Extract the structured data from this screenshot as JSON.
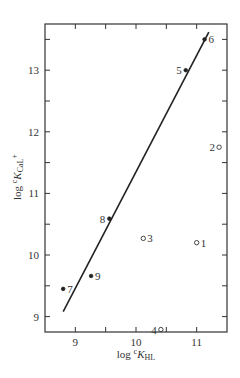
{
  "chart_data": {
    "type": "scatter",
    "title": "",
    "xlabel": "log cK_HL",
    "ylabel": "log cK_CaL+",
    "xlabel_parts": {
      "prefix": "log ",
      "sup": "c",
      "main": "K",
      "sub": "HL",
      "suffix": ""
    },
    "ylabel_parts": {
      "prefix": "log ",
      "sup": "c",
      "main": "K",
      "sub": "CaL",
      "suffix": "+"
    },
    "xlim": [
      8.5,
      11.5
    ],
    "ylim": [
      8.75,
      13.75
    ],
    "x_ticks": [
      9,
      10,
      11
    ],
    "x_minor_ticks": [
      9,
      9.5,
      10,
      10.5,
      11
    ],
    "y_ticks": [
      9,
      10,
      11,
      12,
      13
    ],
    "y_minor_ticks": [
      9,
      9.5,
      10,
      10.5,
      11,
      11.5,
      12,
      12.5,
      13,
      13.5
    ],
    "grid": false,
    "legend": null,
    "points": [
      {
        "label": "1",
        "x": 11.0,
        "y": 10.2,
        "marker": "open",
        "label_side": "right"
      },
      {
        "label": "2",
        "x": 11.37,
        "y": 11.75,
        "marker": "open",
        "label_side": "left"
      },
      {
        "label": "3",
        "x": 10.12,
        "y": 10.27,
        "marker": "open",
        "label_side": "right"
      },
      {
        "label": "4",
        "x": 10.41,
        "y": 8.79,
        "marker": "open",
        "label_side": "left"
      },
      {
        "label": "5",
        "x": 10.82,
        "y": 13.0,
        "marker": "filled",
        "label_side": "left"
      },
      {
        "label": "6",
        "x": 11.13,
        "y": 13.5,
        "marker": "filled",
        "label_side": "right"
      },
      {
        "label": "7",
        "x": 8.8,
        "y": 9.45,
        "marker": "filled",
        "label_side": "right"
      },
      {
        "label": "8",
        "x": 9.56,
        "y": 10.59,
        "marker": "filled",
        "label_side": "left"
      },
      {
        "label": "9",
        "x": 9.26,
        "y": 9.66,
        "marker": "filled",
        "label_side": "right"
      }
    ],
    "fit_line": {
      "x": [
        8.8,
        11.2
      ],
      "y": [
        9.08,
        13.62
      ]
    },
    "annotations": []
  }
}
